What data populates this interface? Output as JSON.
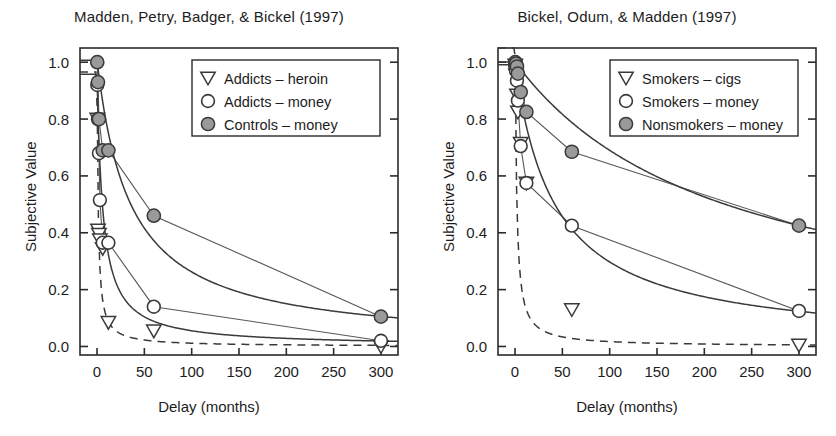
{
  "figure": {
    "axis_label_x": "Delay (months)",
    "axis_label_y": "Subjective Value"
  },
  "chart_data": [
    {
      "type": "scatter",
      "panel": "left",
      "title": "Madden, Petry, Badger, & Bickel (1997)",
      "xlabel": "Delay (months)",
      "ylabel": "Subjective Value",
      "xlim": [
        -18,
        318
      ],
      "ylim": [
        -0.03,
        1.05
      ],
      "xticks": [
        0,
        50,
        100,
        150,
        200,
        250,
        300
      ],
      "xticklabels": [
        "0",
        "50",
        "100",
        "150",
        "200",
        "250",
        "300"
      ],
      "yticks": [
        0.0,
        0.2,
        0.4,
        0.6,
        0.8,
        1.0
      ],
      "yticklabels": [
        "0.0",
        "0.2",
        "0.4",
        "0.6",
        "0.8",
        "1.0"
      ],
      "grid": false,
      "legend_position": "upper right",
      "series": [
        {
          "name": "Addicts – heroin",
          "marker": "triangle-down-open",
          "line": "dashed",
          "x": [
            0.25,
            1,
            2,
            3,
            6,
            12,
            60,
            300
          ],
          "y": [
            0.8,
            0.41,
            0.395,
            0.375,
            0.345,
            0.085,
            0.055,
            0.0
          ]
        },
        {
          "name": "Addicts – money",
          "marker": "circle-open",
          "line": "solid",
          "x": [
            0.25,
            1,
            2,
            3,
            6,
            12,
            60,
            300
          ],
          "y": [
            0.92,
            0.8,
            0.68,
            0.515,
            0.365,
            0.365,
            0.14,
            0.02
          ]
        },
        {
          "name": "Controls – money",
          "marker": "circle-filled",
          "line": "solid",
          "x": [
            0.25,
            1,
            2,
            6,
            12,
            60,
            300
          ],
          "y": [
            1.0,
            0.93,
            0.8,
            0.69,
            0.69,
            0.46,
            0.105
          ]
        }
      ]
    },
    {
      "type": "scatter",
      "panel": "right",
      "title": "Bickel, Odum, & Madden (1997)",
      "xlabel": "Delay (months)",
      "ylabel": "Subjective Value",
      "xlim": [
        -18,
        318
      ],
      "ylim": [
        -0.03,
        1.05
      ],
      "xticks": [
        0,
        50,
        100,
        150,
        200,
        250,
        300
      ],
      "xticklabels": [
        "0",
        "50",
        "100",
        "150",
        "200",
        "250",
        "300"
      ],
      "yticks": [
        0.0,
        0.2,
        0.4,
        0.6,
        0.8,
        1.0
      ],
      "yticklabels": [
        "0.0",
        "0.2",
        "0.4",
        "0.6",
        "0.8",
        "1.0"
      ],
      "grid": false,
      "legend_position": "upper right",
      "series": [
        {
          "name": "Smokers – cigs",
          "marker": "triangle-down-open",
          "line": "dashed",
          "x": [
            0.25,
            1,
            2,
            3,
            6,
            12,
            60,
            300
          ],
          "y": [
            0.99,
            0.955,
            0.885,
            0.825,
            0.715,
            0.575,
            0.13,
            0.005
          ]
        },
        {
          "name": "Smokers – money",
          "marker": "circle-open",
          "line": "solid",
          "x": [
            0.25,
            1,
            2,
            3,
            6,
            12,
            60,
            300
          ],
          "y": [
            0.985,
            0.97,
            0.935,
            0.865,
            0.705,
            0.575,
            0.425,
            0.125
          ]
        },
        {
          "name": "Nonsmokers – money",
          "marker": "circle-filled",
          "line": "solid",
          "x": [
            0.25,
            1,
            2,
            3,
            6,
            12,
            60,
            300
          ],
          "y": [
            1.0,
            0.995,
            0.985,
            0.96,
            0.895,
            0.825,
            0.685,
            0.425
          ]
        }
      ]
    }
  ],
  "panels": [
    {
      "id": "left",
      "title": "Madden, Petry, Badger, & Bickel (1997)",
      "legend": [
        {
          "marker": "triangle-down-open",
          "label": "Addicts – heroin"
        },
        {
          "marker": "circle-open",
          "label": "Addicts – money"
        },
        {
          "marker": "circle-filled",
          "label": "Controls – money"
        }
      ]
    },
    {
      "id": "right",
      "title": "Bickel, Odum, & Madden (1997)",
      "legend": [
        {
          "marker": "triangle-down-open",
          "label": "Smokers – cigs"
        },
        {
          "marker": "circle-open",
          "label": "Smokers – money"
        },
        {
          "marker": "circle-filled",
          "label": "Nonsmokers – money"
        }
      ]
    }
  ],
  "colors": {
    "axis": "#2a2a2a",
    "marker_fill_gray": "#9a9a9a",
    "marker_stroke": "#3a3a3a",
    "curve": "#3a3a3a",
    "background": "#ffffff"
  }
}
